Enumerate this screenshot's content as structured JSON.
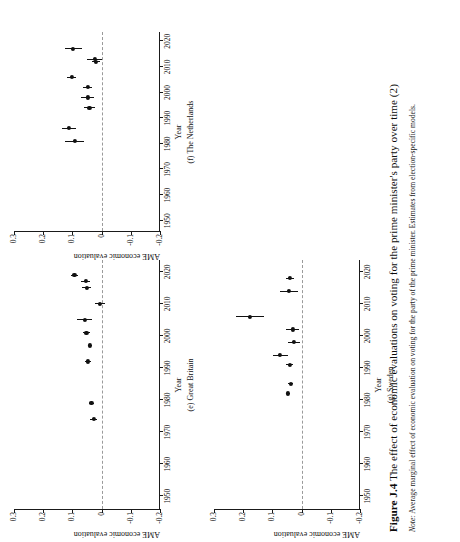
{
  "figure": {
    "number_label": "Figure J.4",
    "title": "The effect of economic evaluations on voting for the prime minister's party over time (2)",
    "note_lead": "Note:",
    "note_text": "Average marginal effect of economic evaluation on voting for the party of the prime minister. Estimates from election-specific models."
  },
  "axes": {
    "x_title": "Year",
    "y_title": "AME economic evaluation",
    "x_ticks": [
      "1950",
      "1960",
      "1970",
      "1980",
      "1990",
      "2000",
      "2010",
      "2020"
    ],
    "x_tick_values": [
      1950,
      1960,
      1970,
      1980,
      1990,
      2000,
      2010,
      2020
    ],
    "y_ticks": [
      "0.3",
      "0.2",
      "0.1",
      "0",
      "-0.1",
      "-0.2"
    ],
    "y_tick_values": [
      0.3,
      0.2,
      0.1,
      0,
      -0.1,
      -0.2
    ],
    "xlim": [
      1946,
      2024
    ],
    "ylim": [
      -0.2,
      0.3
    ],
    "zero_reference": 0
  },
  "chart_data": {
    "type": "scatter",
    "title": "The effect of economic evaluations on voting for the prime minister's party over time (2)",
    "xlabel": "Year",
    "ylabel": "AME economic evaluation",
    "xlim": [
      1946,
      2024
    ],
    "ylim": [
      -0.2,
      0.3
    ],
    "grid": false,
    "legend": "none",
    "annotations": [
      "dashed horizontal reference line at y = 0"
    ],
    "panels": [
      {
        "key": "netherlands",
        "caption": "(f) The Netherlands",
        "label": "(f)",
        "country": "The Netherlands",
        "series_name": "AME economic evaluation",
        "points": [
          {
            "x": 1981,
            "y": 0.092,
            "lo": 0.06,
            "hi": 0.124
          },
          {
            "x": 1986,
            "y": 0.111,
            "lo": 0.087,
            "hi": 0.135
          },
          {
            "x": 1994,
            "y": 0.042,
            "lo": 0.024,
            "hi": 0.06
          },
          {
            "x": 1998,
            "y": 0.048,
            "lo": 0.026,
            "hi": 0.07
          },
          {
            "x": 2002,
            "y": 0.047,
            "lo": 0.032,
            "hi": 0.062
          },
          {
            "x": 2006,
            "y": 0.103,
            "lo": 0.087,
            "hi": 0.119
          },
          {
            "x": 2012,
            "y": 0.019,
            "lo": 0.004,
            "hi": 0.034
          },
          {
            "x": 2013,
            "y": 0.024,
            "lo": -0.003,
            "hi": 0.051
          },
          {
            "x": 2017,
            "y": 0.097,
            "lo": 0.068,
            "hi": 0.126
          }
        ]
      },
      {
        "key": "great_britain",
        "caption": "(e) Great Britain",
        "label": "(e)",
        "country": "Great Britain",
        "series_name": "AME economic evaluation",
        "points": [
          {
            "x": 1974,
            "y": 0.027,
            "lo": 0.014,
            "hi": 0.04
          },
          {
            "x": 1979,
            "y": 0.035,
            "lo": 0.026,
            "hi": 0.044
          },
          {
            "x": 1992,
            "y": 0.046,
            "lo": 0.036,
            "hi": 0.056
          },
          {
            "x": 1997,
            "y": 0.04,
            "lo": 0.033,
            "hi": 0.047
          },
          {
            "x": 2001,
            "y": 0.052,
            "lo": 0.041,
            "hi": 0.063
          },
          {
            "x": 2005,
            "y": 0.058,
            "lo": 0.033,
            "hi": 0.083
          },
          {
            "x": 2010,
            "y": 0.006,
            "lo": -0.01,
            "hi": 0.022
          },
          {
            "x": 2015,
            "y": 0.051,
            "lo": 0.036,
            "hi": 0.066
          },
          {
            "x": 2017,
            "y": 0.055,
            "lo": 0.041,
            "hi": 0.069
          },
          {
            "x": 2019,
            "y": 0.093,
            "lo": 0.08,
            "hi": 0.106
          }
        ]
      },
      {
        "key": "sweden",
        "caption": "(g) Sweden",
        "label": "(g)",
        "country": "Sweden",
        "series_name": "AME economic evaluation",
        "points": [
          {
            "x": 1982,
            "y": 0.047,
            "lo": 0.04,
            "hi": 0.054
          },
          {
            "x": 1985,
            "y": 0.037,
            "lo": 0.028,
            "hi": 0.046
          },
          {
            "x": 1991,
            "y": 0.041,
            "lo": 0.029,
            "hi": 0.053
          },
          {
            "x": 1994,
            "y": 0.073,
            "lo": 0.047,
            "hi": 0.099
          },
          {
            "x": 1998,
            "y": 0.026,
            "lo": 0.005,
            "hi": 0.047
          },
          {
            "x": 2002,
            "y": 0.031,
            "lo": 0.009,
            "hi": 0.053
          },
          {
            "x": 2006,
            "y": 0.177,
            "lo": 0.128,
            "hi": 0.226
          },
          {
            "x": 2014,
            "y": 0.044,
            "lo": 0.013,
            "hi": 0.075
          },
          {
            "x": 2018,
            "y": 0.039,
            "lo": 0.026,
            "hi": 0.052
          }
        ]
      }
    ]
  }
}
